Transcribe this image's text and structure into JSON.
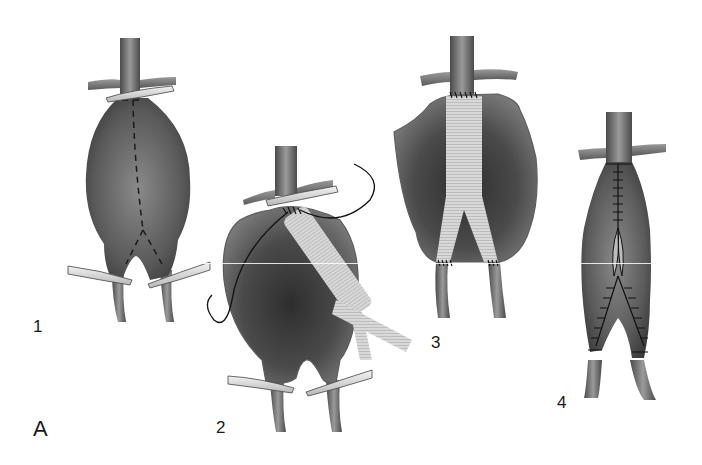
{
  "figure": {
    "panel_letter": "A",
    "steps": [
      {
        "number": "1",
        "description": "Abdominal aortic aneurysm clamped proximally and at both iliac arteries; dashed incision line along the sac"
      },
      {
        "number": "2",
        "description": "Aneurysm sac opened; proximal anastomosis of bifurcated graft being sewn with running suture"
      },
      {
        "number": "3",
        "description": "Bifurcated graft sewn in place proximally and to both iliac arteries within the opened sac"
      },
      {
        "number": "4",
        "description": "Aneurysm sac closed over the graft with sutures"
      }
    ]
  },
  "colors": {
    "background": "#ffffff",
    "vessel_dark": "#3a3a3a",
    "vessel_mid": "#6e6e6e",
    "vessel_light": "#a8a8a8",
    "graft": "#d6d6d6",
    "clamp": "#e8e8e8",
    "suture": "#111111",
    "label_text": "#1a1a1a"
  }
}
